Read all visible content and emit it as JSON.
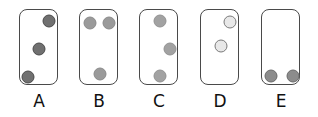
{
  "options": [
    {
      "label": "A",
      "card_left": 19,
      "fill": "#707070",
      "stroke": "#4a4a4a",
      "dots": [
        {
          "x": 29,
          "y": 11
        },
        {
          "x": 19,
          "y": 39
        },
        {
          "x": 8,
          "y": 67
        }
      ]
    },
    {
      "label": "B",
      "card_left": 79,
      "fill": "#9a9a9a",
      "stroke": "#8a8a8a",
      "dots": [
        {
          "x": 10,
          "y": 13
        },
        {
          "x": 29,
          "y": 13
        },
        {
          "x": 20,
          "y": 64
        }
      ]
    },
    {
      "label": "C",
      "card_left": 139,
      "fill": "#a2a2a2",
      "stroke": "#929292",
      "dots": [
        {
          "x": 20,
          "y": 11
        },
        {
          "x": 30,
          "y": 39
        },
        {
          "x": 20,
          "y": 66
        }
      ]
    },
    {
      "label": "D",
      "card_left": 200,
      "fill": "#e8e8e8",
      "stroke": "#7a7a7a",
      "dots": [
        {
          "x": 29,
          "y": 12
        },
        {
          "x": 20,
          "y": 36
        }
      ]
    },
    {
      "label": "E",
      "card_left": 261,
      "fill": "#8c8c8c",
      "stroke": "#6a6a6a",
      "dots": [
        {
          "x": 9,
          "y": 66
        },
        {
          "x": 31,
          "y": 66
        }
      ]
    }
  ]
}
